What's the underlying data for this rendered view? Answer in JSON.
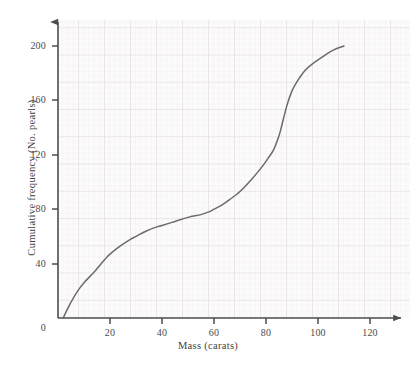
{
  "chart_data": {
    "type": "line",
    "title": "",
    "subtitle": "",
    "xlabel": "Mass (carats)",
    "ylabel": "Cumulative frequency (No. pearls)",
    "xlim": [
      0,
      130
    ],
    "ylim": [
      0,
      215
    ],
    "xticks": [
      0,
      20,
      40,
      60,
      80,
      100,
      120
    ],
    "xticklabels": [
      "0",
      "20",
      "40",
      "60",
      "80",
      "100",
      "120"
    ],
    "yticks": [
      0,
      40,
      80,
      120,
      160,
      200
    ],
    "yticklabels": [
      "0",
      "40",
      "80",
      "120",
      "160",
      "200"
    ],
    "grid": true,
    "grid_style": "graph-paper minor 2-unit / major 10-unit",
    "legend": "none",
    "series": [
      {
        "name": "Cumulative frequency",
        "color": "#6b6b6b",
        "x": [
          2,
          4,
          6,
          8,
          10,
          14,
          18,
          20,
          24,
          28,
          30,
          34,
          38,
          40,
          45,
          50,
          55,
          58,
          60,
          63,
          66,
          70,
          74,
          78,
          81,
          83,
          85,
          86,
          88,
          90,
          92,
          95,
          98,
          101,
          104,
          107,
          110
        ],
        "y": [
          0,
          8,
          15,
          21,
          26,
          34,
          43,
          47,
          53,
          58,
          60,
          64,
          67,
          68,
          71,
          74,
          76,
          78,
          80,
          83,
          87,
          93,
          101,
          110,
          118,
          124,
          134,
          141,
          156,
          167,
          174,
          182,
          187,
          191,
          195,
          198,
          200
        ]
      }
    ],
    "axis_style": {
      "arrowheads": true,
      "axis_color": "#4d4d4d",
      "grid_major_color": "#d9d0d2",
      "grid_minor_color": "#efe7e9",
      "plot_background": "#fcfbfb"
    }
  },
  "ticks": {
    "x": [
      {
        "label": "0",
        "px": 58
      },
      {
        "label": "20",
        "px": 110
      },
      {
        "label": "40",
        "px": 162
      },
      {
        "label": "60",
        "px": 214
      },
      {
        "label": "80",
        "px": 266
      },
      {
        "label": "100",
        "px": 318
      },
      {
        "label": "120",
        "px": 370
      }
    ],
    "y": [
      {
        "label": "0",
        "px": 318
      },
      {
        "label": "40",
        "px": 264
      },
      {
        "label": "80",
        "px": 209
      },
      {
        "label": "120",
        "px": 155
      },
      {
        "label": "160",
        "px": 100
      },
      {
        "label": "200",
        "px": 46
      }
    ]
  }
}
